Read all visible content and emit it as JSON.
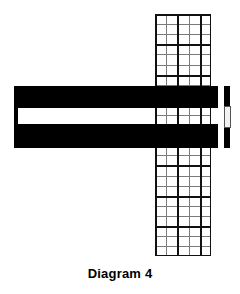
{
  "figure": {
    "caption": "Diagram 4",
    "caption_font_size_px": 13,
    "caption_top_px": 266,
    "background_color": "#ffffff",
    "ink_color": "#000000"
  },
  "grid": {
    "name": "graph-paper-column",
    "left_px": 155,
    "top_px": 14,
    "width_px": 56,
    "height_px": 242,
    "columns": 5,
    "rows": 24,
    "cell_width_px": 11.2,
    "cell_height_px": 10.1,
    "minor_line_color": "#7a7a7a",
    "minor_line_width_px": 1,
    "major_line_color": "#111111",
    "major_line_width_px": 2,
    "major_every_columns": 2,
    "major_every_rows": 3,
    "frame_color": "#111111"
  },
  "bars": [
    {
      "name": "upper-horizontal-bar",
      "left_px": 14,
      "top_px": 86,
      "width_px": 204,
      "height_px": 22,
      "color": "#000000"
    },
    {
      "name": "lower-horizontal-bar",
      "left_px": 14,
      "top_px": 124,
      "width_px": 204,
      "height_px": 24,
      "color": "#000000"
    },
    {
      "name": "left-connector-bar",
      "left_px": 14,
      "top_px": 86,
      "width_px": 4,
      "height_px": 62,
      "color": "#000000"
    }
  ],
  "post": {
    "name": "right-vertical-post",
    "left_px": 224,
    "top_px": 86,
    "width_px": 6,
    "height_px": 62,
    "color": "#000000",
    "insert": {
      "name": "post-insert",
      "left_px": 224,
      "top_px": 106,
      "width_px": 7,
      "height_px": 22,
      "fill_color": "#f2f2f2",
      "edge_color": "#555555"
    }
  }
}
